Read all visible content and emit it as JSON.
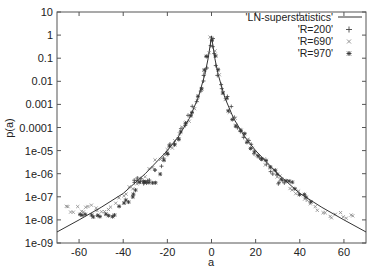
{
  "chart_data": {
    "type": "scatter",
    "title": "",
    "xlabel": "a",
    "ylabel": "p(a)",
    "xlim": [
      -70,
      70
    ],
    "ylim": [
      1e-09,
      10
    ],
    "yscale": "log",
    "grid": false,
    "legend_position": "top-right",
    "x_ticks": [
      -60,
      -40,
      -20,
      0,
      20,
      40,
      60
    ],
    "x_tick_labels": [
      "-60",
      "-40",
      "-20",
      "0",
      "20",
      "40",
      "60"
    ],
    "y_ticks": [
      10,
      1,
      0.1,
      0.01,
      0.001,
      0.0001,
      1e-05,
      1e-06,
      1e-07,
      1e-08,
      1e-09
    ],
    "y_tick_labels": [
      "10",
      "1",
      "0.1",
      "0.01",
      "0.001",
      "0.0001",
      "1e-05",
      "1e-06",
      "1e-07",
      "1e-08",
      "1e-09"
    ],
    "series": [
      {
        "name": "'LN-superstatistics'",
        "style": "line",
        "x": [
          -70,
          -60,
          -50,
          -40,
          -30,
          -20,
          -15,
          -10,
          -6,
          -3,
          -1.5,
          0,
          1.5,
          3,
          6,
          10,
          15,
          20,
          30,
          40,
          50,
          60,
          70
        ],
        "y": [
          3e-09,
          1e-08,
          3.5e-08,
          1.4e-07,
          1e-06,
          1e-05,
          4e-05,
          0.00025,
          0.002,
          0.02,
          0.1,
          0.9,
          0.1,
          0.02,
          0.002,
          0.00025,
          4e-05,
          1e-05,
          1e-06,
          1.4e-07,
          3.5e-08,
          1e-08,
          3e-09
        ]
      },
      {
        "name": "'R=200'",
        "marker": "+",
        "x": [
          -35,
          -33,
          -31,
          -29,
          -25,
          -20,
          -15,
          -10,
          -5,
          -2,
          0,
          2,
          5,
          10,
          15,
          20,
          25,
          30,
          33
        ],
        "y": [
          5e-07,
          5e-07,
          5e-07,
          5e-07,
          1.5e-06,
          8e-06,
          4e-05,
          0.00025,
          0.004,
          0.05,
          0.8,
          0.05,
          0.004,
          0.00025,
          4e-05,
          8e-06,
          2e-06,
          5e-07,
          4e-07
        ]
      },
      {
        "name": "'R=690'",
        "marker": "x",
        "x": [
          -66,
          -62,
          -58,
          -54,
          -50,
          -45,
          -40,
          -35,
          -30,
          -25,
          -20,
          -15,
          -10,
          -5,
          0,
          5,
          10,
          15,
          20,
          25,
          30,
          35,
          40,
          45,
          50,
          55,
          60,
          64
        ],
        "y": [
          3e-08,
          3e-08,
          3e-08,
          5e-08,
          3e-08,
          3e-08,
          1e-07,
          3e-07,
          8e-07,
          3e-06,
          8e-06,
          4e-05,
          0.00025,
          0.004,
          0.9,
          0.004,
          0.00025,
          4e-05,
          8e-06,
          3e-06,
          1e-06,
          3e-07,
          1.5e-07,
          6e-08,
          1.5e-08,
          1.5e-08,
          1.5e-08,
          1.5e-08
        ]
      },
      {
        "name": "'R=970'",
        "marker": "*",
        "x": [
          -60,
          -55,
          -50,
          -45,
          -40,
          -30,
          -25,
          -20,
          -15,
          -10,
          -5,
          0,
          5,
          10,
          15,
          20,
          25,
          30,
          35,
          40,
          45
        ],
        "y": [
          1.5e-08,
          1.5e-08,
          1.5e-08,
          1.5e-08,
          4e-08,
          6e-07,
          4e-07,
          1e-05,
          4e-05,
          0.00025,
          0.004,
          0.8,
          0.004,
          0.00025,
          4e-05,
          1e-05,
          3e-06,
          8e-07,
          5e-07,
          1.5e-07,
          6e-08
        ]
      }
    ]
  },
  "legend": {
    "items": [
      {
        "label": "'LN-superstatistics'",
        "symbol": "line"
      },
      {
        "label": "'R=200'",
        "symbol": "+"
      },
      {
        "label": "'R=690'",
        "symbol": "×"
      },
      {
        "label": "'R=970'",
        "symbol": "✱"
      }
    ]
  },
  "axes": {
    "xlabel": "a",
    "ylabel": "p(a)"
  },
  "colors": {
    "line": "#333333",
    "markers": "#444444",
    "markers_light": "#777777",
    "frame": "#555555"
  }
}
